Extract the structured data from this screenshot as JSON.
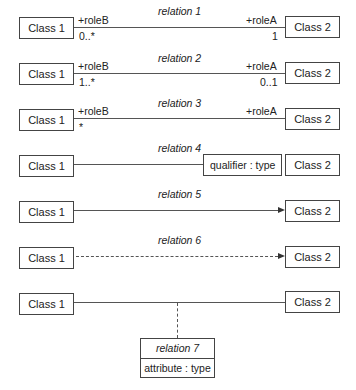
{
  "diagram": {
    "rows": [
      {
        "name": "relation 1",
        "class_left": "Class 1",
        "class_right": "Class 2",
        "role_left": "+roleB",
        "role_right": "+roleA",
        "mult_left": "0..*",
        "mult_right": "1",
        "line": "solid"
      },
      {
        "name": "relation 2",
        "class_left": "Class 1",
        "class_right": "Class 2",
        "role_left": "+roleB",
        "role_right": "+roleA",
        "mult_left": "1..*",
        "mult_right": "0..1",
        "line": "solid"
      },
      {
        "name": "relation 3",
        "class_left": "Class 1",
        "class_right": "Class 2",
        "role_left": "+roleB",
        "role_right": "+roleA",
        "mult_left": "*",
        "line": "solid"
      },
      {
        "name": "relation 4",
        "class_left": "Class 1",
        "class_right": "Class 2",
        "qualifier": "qualifier : type",
        "line": "solid"
      },
      {
        "name": "relation 5",
        "class_left": "Class 1",
        "class_right": "Class 2",
        "line": "solid-arrow"
      },
      {
        "name": "relation 6",
        "class_left": "Class 1",
        "class_right": "Class 2",
        "line": "dashed-arrow"
      },
      {
        "class_left": "Class 1",
        "class_right": "Class 2",
        "line": "solid",
        "association_class": {
          "name": "relation 7",
          "attribute": "attribute : type"
        }
      }
    ]
  }
}
